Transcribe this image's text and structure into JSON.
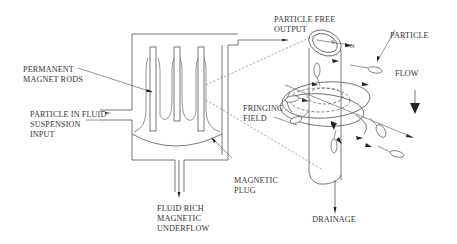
{
  "diagram": {
    "labels": {
      "magnet_rods": [
        "PERMANENT",
        "MAGNET RODS"
      ],
      "input": [
        "PARTICLE IN FLUID",
        "SUSPENSION",
        "INPUT"
      ],
      "output": [
        "PARTICLE FREE",
        "OUTPUT"
      ],
      "particle": "PARTICLE",
      "flow": "FLOW",
      "fringing_field": [
        "FRINGING",
        "FIELD"
      ],
      "magnetic_plug": [
        "MAGNETIC",
        "PLUG"
      ],
      "underflow": [
        "FLUID RICH",
        "MAGNETIC",
        "UNDERFLOW"
      ],
      "drainage": "DRAINAGE",
      "pole_south": "S",
      "pole_north": "N"
    },
    "colors": {
      "line": "#555555",
      "text": "#333333",
      "arrow": "#222222",
      "background": "#ffffff"
    }
  }
}
